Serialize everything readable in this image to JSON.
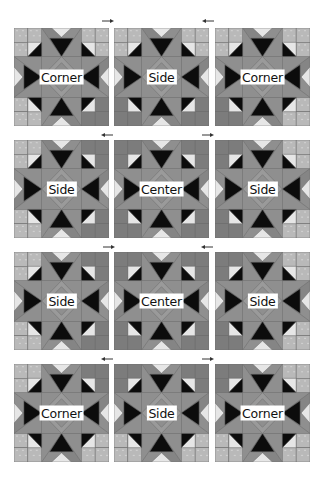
{
  "diagram": {
    "type": "quilt-block-layout",
    "rows": 4,
    "cols": 3,
    "colors": {
      "background": "#ffffff",
      "light_fabric": "#b9b9b9",
      "light_fabric_texture": "#cfcfcf",
      "dark_fabric": "#7c7c7c",
      "star_arm": "#8f8f8f",
      "star_arm_dark": "#858585",
      "point_light": "#e6e6e6",
      "point_black": "#0c0c0c",
      "center_diamond": "#9a9a9a",
      "seam": "#6a6a6a",
      "label_bg": "#ffffff",
      "label_text": "#111111",
      "arrow": "#333333"
    },
    "blocks": [
      {
        "row": 0,
        "col": 0,
        "label": "Corner",
        "x": 14,
        "y": 28,
        "light_corners": [
          "tl",
          "tr",
          "bl"
        ]
      },
      {
        "row": 0,
        "col": 1,
        "label": "Side",
        "x": 114,
        "y": 28,
        "light_corners": [
          "tl",
          "tr"
        ]
      },
      {
        "row": 0,
        "col": 2,
        "label": "Corner",
        "x": 215,
        "y": 28,
        "light_corners": [
          "tl",
          "tr",
          "br"
        ]
      },
      {
        "row": 1,
        "col": 0,
        "label": "Side",
        "x": 14,
        "y": 140,
        "light_corners": [
          "tl",
          "bl"
        ]
      },
      {
        "row": 1,
        "col": 1,
        "label": "Center",
        "x": 114,
        "y": 140,
        "light_corners": []
      },
      {
        "row": 1,
        "col": 2,
        "label": "Side",
        "x": 215,
        "y": 140,
        "light_corners": [
          "tr",
          "br"
        ]
      },
      {
        "row": 2,
        "col": 0,
        "label": "Side",
        "x": 14,
        "y": 252,
        "light_corners": [
          "tl",
          "bl"
        ]
      },
      {
        "row": 2,
        "col": 1,
        "label": "Center",
        "x": 114,
        "y": 252,
        "light_corners": []
      },
      {
        "row": 2,
        "col": 2,
        "label": "Side",
        "x": 215,
        "y": 252,
        "light_corners": [
          "tr",
          "br"
        ]
      },
      {
        "row": 3,
        "col": 0,
        "label": "Corner",
        "x": 14,
        "y": 364,
        "light_corners": [
          "tl",
          "bl",
          "br"
        ]
      },
      {
        "row": 3,
        "col": 1,
        "label": "Side",
        "x": 114,
        "y": 364,
        "light_corners": [
          "bl",
          "br"
        ]
      },
      {
        "row": 3,
        "col": 2,
        "label": "Corner",
        "x": 215,
        "y": 364,
        "light_corners": [
          "tr",
          "bl",
          "br"
        ]
      }
    ],
    "arrows": [
      {
        "row": 0,
        "x": 102,
        "y": 19,
        "direction": "right"
      },
      {
        "row": 0,
        "x": 202,
        "y": 19,
        "direction": "left"
      },
      {
        "row": 1,
        "x": 101,
        "y": 133,
        "direction": "left"
      },
      {
        "row": 1,
        "x": 202,
        "y": 133,
        "direction": "right"
      },
      {
        "row": 2,
        "x": 103,
        "y": 245,
        "direction": "right"
      },
      {
        "row": 2,
        "x": 201,
        "y": 245,
        "direction": "left"
      },
      {
        "row": 3,
        "x": 101,
        "y": 357,
        "direction": "left"
      },
      {
        "row": 3,
        "x": 202,
        "y": 357,
        "direction": "right"
      }
    ]
  }
}
